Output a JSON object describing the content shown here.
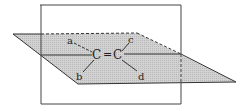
{
  "diagram": {
    "atoms": {
      "c1": "C",
      "c2": "C",
      "double_bond": "="
    },
    "substituents": {
      "a": "a",
      "b": "b",
      "c": "c",
      "d": "d"
    },
    "colors": {
      "plane_fill": "#c8c8c8",
      "stroke": "#333333",
      "background": "#ffffff"
    }
  }
}
